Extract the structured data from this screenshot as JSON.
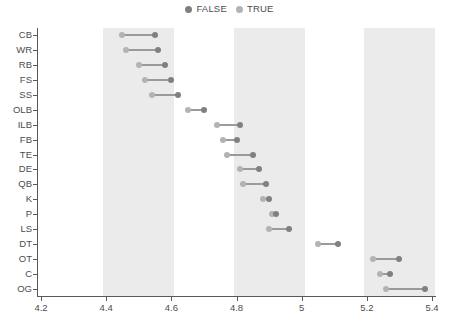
{
  "legend": {
    "items": [
      {
        "label": "FALSE",
        "color": "#808080",
        "icon": "circle-marker-icon"
      },
      {
        "label": "TRUE",
        "color": "#b3b3b3",
        "icon": "circle-marker-icon"
      }
    ]
  },
  "axes": {
    "x": {
      "ticks": [
        "4.2",
        "4.4",
        "4.6",
        "4.8",
        "5",
        "5.2",
        "5.4"
      ],
      "min": 4.2,
      "max": 5.4,
      "label": ""
    },
    "y": {
      "label": "",
      "categories": [
        "CB",
        "WR",
        "RB",
        "FS",
        "SS",
        "OLB",
        "ILB",
        "FB",
        "TE",
        "DE",
        "QB",
        "K",
        "P",
        "LS",
        "DT",
        "OT",
        "C",
        "OG"
      ]
    }
  },
  "bands": [
    {
      "from": 4.4,
      "to": 4.6,
      "color": "#ebebeb"
    },
    {
      "from": 4.8,
      "to": 5.0,
      "color": "#ebebeb"
    },
    {
      "from": 5.2,
      "to": 5.4,
      "color": "#ebebeb"
    }
  ],
  "chart_data": {
    "type": "scatter",
    "subtype": "dumbbell",
    "title": "",
    "xlabel": "",
    "ylabel": "",
    "xlim": [
      4.2,
      5.4
    ],
    "grid": false,
    "legend_position": "top-center",
    "categories": [
      "CB",
      "WR",
      "RB",
      "FS",
      "SS",
      "OLB",
      "ILB",
      "FB",
      "TE",
      "DE",
      "QB",
      "K",
      "P",
      "LS",
      "DT",
      "OT",
      "C",
      "OG"
    ],
    "series": [
      {
        "name": "TRUE",
        "color": "#b3b3b3",
        "values": [
          4.45,
          4.46,
          4.5,
          4.52,
          4.54,
          4.65,
          4.74,
          4.76,
          4.77,
          4.81,
          4.82,
          4.88,
          4.91,
          4.9,
          5.05,
          5.22,
          5.24,
          5.26
        ]
      },
      {
        "name": "FALSE",
        "color": "#808080",
        "values": [
          4.55,
          4.56,
          4.58,
          4.6,
          4.62,
          4.7,
          4.81,
          4.8,
          4.85,
          4.87,
          4.89,
          4.9,
          4.92,
          4.96,
          5.11,
          5.3,
          5.27,
          5.38
        ]
      }
    ]
  }
}
